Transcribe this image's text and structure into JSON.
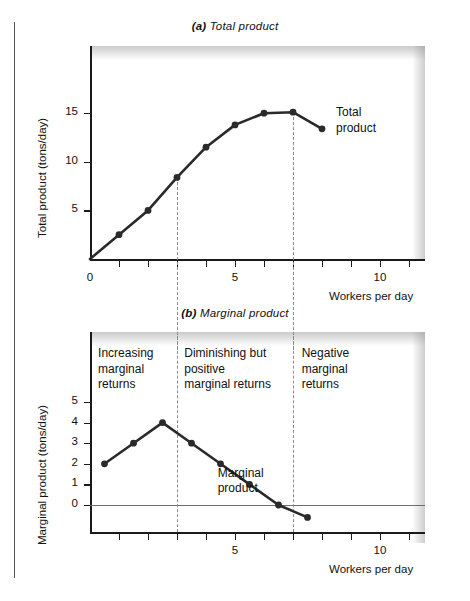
{
  "figure": {
    "panel_a_title_tag": "(a)",
    "panel_a_title_text": " Total product",
    "panel_b_title_tag": "(b)",
    "panel_b_title_text": " Marginal product",
    "x_axis_title": "Workers per day",
    "divider_workers": [
      3,
      7
    ]
  },
  "chart_data": [
    {
      "type": "line",
      "title": "(a) Total product",
      "xlabel": "Workers per day",
      "ylabel": "Total product (tons/day)",
      "xlim": [
        0,
        11.6
      ],
      "ylim": [
        -0.6,
        19.5
      ],
      "xticks": [
        0,
        1,
        2,
        3,
        4,
        5,
        6,
        7,
        8,
        9,
        10,
        11
      ],
      "xtick_labels": [
        "0",
        "",
        "",
        "",
        "",
        "5",
        "",
        "",
        "",
        "",
        "10",
        ""
      ],
      "yticks": [
        5,
        10,
        15
      ],
      "ytick_labels": [
        "5",
        "10",
        "15"
      ],
      "grid": false,
      "series": [
        {
          "name": "Total product",
          "x": [
            0,
            1,
            2,
            3,
            4,
            5,
            6,
            7,
            8
          ],
          "values": [
            0,
            2.5,
            5.0,
            8.4,
            11.5,
            13.8,
            15.0,
            15.1,
            13.4
          ],
          "label": "Total\nproduct",
          "color": "#2a2a2a",
          "markers": true
        }
      ]
    },
    {
      "type": "line",
      "title": "(b) Marginal product",
      "xlabel": "Workers per day",
      "ylabel": "Marginal product (tons/day)",
      "xlim": [
        0,
        11.6
      ],
      "ylim": [
        -1.5,
        6.6
      ],
      "xticks": [
        1,
        2,
        3,
        4,
        5,
        6,
        7,
        8,
        9,
        10,
        11
      ],
      "xtick_labels": [
        "",
        "",
        "",
        "",
        "5",
        "",
        "",
        "",
        "",
        "10",
        ""
      ],
      "yticks": [
        0,
        1,
        2,
        3,
        4,
        5
      ],
      "ytick_labels": [
        "0",
        "1",
        "2",
        "3",
        "4",
        "5"
      ],
      "grid": false,
      "zero_line": 0,
      "series": [
        {
          "name": "Marginal product",
          "x": [
            0.5,
            1.5,
            2.5,
            3.5,
            4.5,
            5.5,
            6.5,
            7.5
          ],
          "values": [
            2.0,
            3.0,
            4.0,
            3.0,
            2.0,
            1.0,
            0.0,
            -0.6
          ],
          "label": "Marginal\nproduct",
          "color": "#2a2a2a",
          "markers": true
        }
      ],
      "annotations": [
        {
          "text": "Increasing\nmarginal\nreturns",
          "x_range": [
            0,
            3
          ]
        },
        {
          "text": "Diminishing but\npositive\nmarginal returns",
          "x_range": [
            3,
            7
          ]
        },
        {
          "text": "Negative\nmarginal\nreturns",
          "x_range": [
            7,
            11.6
          ]
        }
      ]
    }
  ]
}
